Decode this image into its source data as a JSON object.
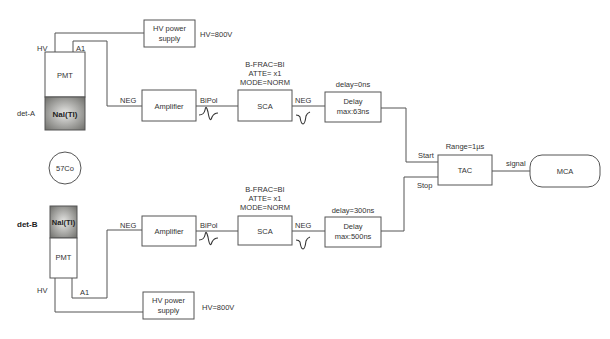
{
  "diagram": {
    "type": "block-diagram",
    "title": "",
    "source": {
      "label": "57Co"
    },
    "detectors": [
      {
        "id": "det-A",
        "label": "det-A",
        "scintillator": "NaI(Tl)",
        "pmt": "PMT",
        "hv_pin": "HV",
        "anode_pin": "A1"
      },
      {
        "id": "det-B",
        "label": "det-B",
        "scintillator": "NaI(Tl)",
        "pmt": "PMT",
        "hv_pin": "HV",
        "anode_pin": "A1"
      }
    ],
    "branch_a": {
      "hv_supply": {
        "label_line1": "HV power",
        "label_line2": "supply",
        "setting": "HV=800V"
      },
      "amp_input": "NEG",
      "amplifier": {
        "label": "Amplifier"
      },
      "amp_output": "BiPol",
      "sca_settings": [
        "B-FRAC=BI",
        "ATTE= x1",
        "MODE=NORM"
      ],
      "sca": {
        "label": "SCA"
      },
      "sca_output": "NEG",
      "delay_setting": "delay=0ns",
      "delay": {
        "label_line1": "Delay",
        "label_line2": "max:63ns"
      }
    },
    "branch_b": {
      "hv_supply": {
        "label_line1": "HV power",
        "label_line2": "supply",
        "setting": "HV=800V"
      },
      "amp_input": "NEG",
      "amplifier": {
        "label": "Amplifier"
      },
      "amp_output": "BiPol",
      "sca_settings": [
        "B-FRAC=BI",
        "ATTE= x1",
        "MODE=NORM"
      ],
      "sca": {
        "label": "SCA"
      },
      "sca_output": "NEG",
      "delay_setting": "delay=300ns",
      "delay": {
        "label_line1": "Delay",
        "label_line2": "max:500ns"
      }
    },
    "tac": {
      "label": "TAC",
      "range": "Range=1µs",
      "start": "Start",
      "stop": "Stop",
      "output": "signal"
    },
    "mca": {
      "label": "MCA"
    },
    "colors": {
      "line": "#555555",
      "text": "#333333",
      "scintillator_center": "#e8e8e6",
      "scintillator_edge": "#6e6e6a"
    }
  }
}
